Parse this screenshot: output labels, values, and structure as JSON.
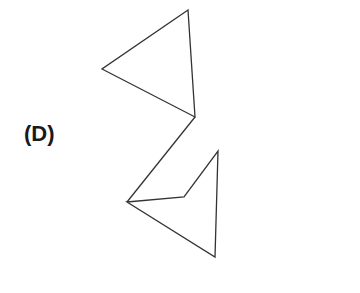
{
  "option_label": "(D)",
  "figure": {
    "stroke_color": "#333333",
    "upper_triangle": [
      [
        188,
        10
      ],
      [
        102,
        69
      ],
      [
        195,
        117
      ]
    ],
    "connector": [
      [
        195,
        117
      ],
      [
        127,
        202
      ]
    ],
    "lower_shape": [
      [
        127,
        202
      ],
      [
        184,
        197
      ],
      [
        218,
        151
      ],
      [
        215,
        257
      ]
    ]
  }
}
